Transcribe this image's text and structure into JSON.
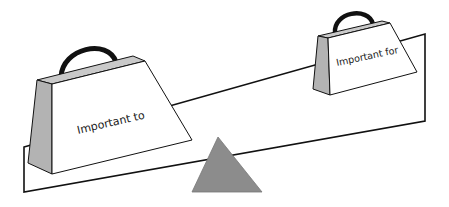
{
  "diagram": {
    "type": "balance-scale",
    "left_weight": {
      "label": "Important to"
    },
    "right_weight": {
      "label": "Important for"
    },
    "colors": {
      "background": "#ffffff",
      "stroke": "#111111",
      "side_face": "#b3b3b3",
      "fulcrum": "#8c8c8c",
      "handle": "#111111"
    }
  }
}
